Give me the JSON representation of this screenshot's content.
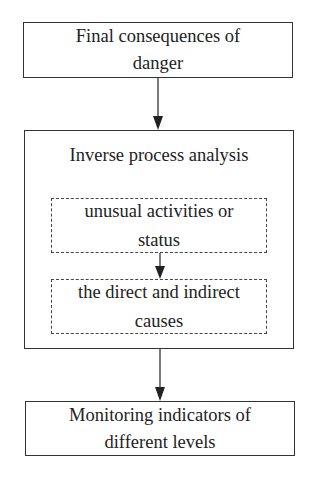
{
  "diagram": {
    "type": "flowchart",
    "nodes": {
      "final_consequences": {
        "label": "Final consequences of danger",
        "line1": "Final consequences of",
        "line2": "danger"
      },
      "inverse_analysis": {
        "label": "Inverse process analysis"
      },
      "unusual_activities": {
        "label": "unusual activities or status",
        "line1": "unusual activities or",
        "line2": "status"
      },
      "direct_indirect_causes": {
        "label": "the direct and indirect causes",
        "line1": "the direct and indirect",
        "line2": "causes"
      },
      "monitoring_indicators": {
        "label": "Monitoring indicators of different levels",
        "line1": "Monitoring indicators of",
        "line2": "different levels"
      }
    },
    "edges": [
      {
        "from": "final_consequences",
        "to": "inverse_analysis"
      },
      {
        "from": "unusual_activities",
        "to": "direct_indirect_causes"
      },
      {
        "from": "inverse_analysis",
        "to": "monitoring_indicators"
      }
    ],
    "colors": {
      "line": "#333333",
      "background": "#ffffff",
      "text": "#222222"
    }
  }
}
